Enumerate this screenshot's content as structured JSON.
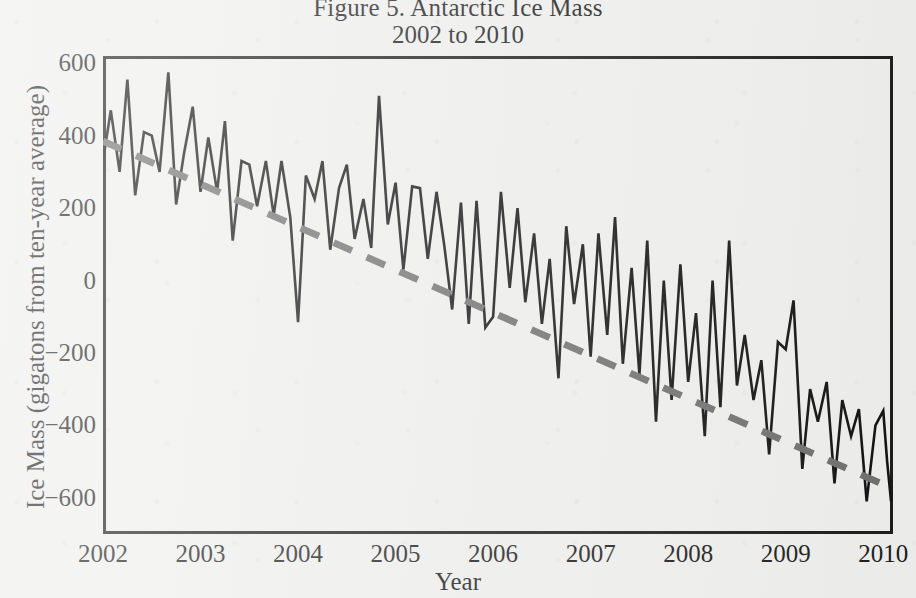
{
  "figure": {
    "title": "Figure 5. Antarctic Ice Mass",
    "subtitle": "2002 to 2010"
  },
  "axis": {
    "x_title": "Year",
    "y_title": "Ice Mass (gigatons from ten-year average)"
  },
  "chart_data": {
    "type": "line",
    "title": "Figure 5. Antarctic Ice Mass",
    "subtitle": "2002 to 2010",
    "xlabel": "Year",
    "ylabel": "Ice Mass (gigatons from ten-year average)",
    "xlim": [
      2002.0,
      2010.1
    ],
    "ylim": [
      -700,
      620
    ],
    "xticks": [
      2002,
      2003,
      2004,
      2005,
      2006,
      2007,
      2008,
      2009,
      2010
    ],
    "xtick_labels": [
      "2002",
      "2003",
      "2004",
      "2005",
      "2006",
      "2007",
      "2008",
      "2009",
      "2010"
    ],
    "yticks": [
      600,
      400,
      200,
      0,
      -200,
      -400,
      -600
    ],
    "ytick_labels": [
      "600",
      "400",
      "200",
      "0",
      "−200",
      "−400",
      "−600"
    ],
    "grid": false,
    "legend": false,
    "frame": true,
    "series": [
      {
        "name": "Ice mass anomaly (monthly)",
        "style": "solid",
        "color": "#111111",
        "linewidth": 2.6,
        "x": [
          2002.0,
          2002.08,
          2002.17,
          2002.25,
          2002.33,
          2002.42,
          2002.5,
          2002.58,
          2002.67,
          2002.75,
          2002.83,
          2002.92,
          2003.0,
          2003.08,
          2003.17,
          2003.25,
          2003.33,
          2003.42,
          2003.5,
          2003.58,
          2003.67,
          2003.75,
          2003.83,
          2003.92,
          2004.0,
          2004.08,
          2004.17,
          2004.25,
          2004.33,
          2004.42,
          2004.5,
          2004.58,
          2004.67,
          2004.75,
          2004.83,
          2004.92,
          2005.0,
          2005.08,
          2005.17,
          2005.25,
          2005.33,
          2005.42,
          2005.5,
          2005.58,
          2005.67,
          2005.75,
          2005.83,
          2005.92,
          2006.0,
          2006.08,
          2006.17,
          2006.25,
          2006.33,
          2006.42,
          2006.5,
          2006.58,
          2006.67,
          2006.75,
          2006.83,
          2006.92,
          2007.0,
          2007.08,
          2007.17,
          2007.25,
          2007.33,
          2007.42,
          2007.5,
          2007.58,
          2007.67,
          2007.75,
          2007.83,
          2007.92,
          2008.0,
          2008.08,
          2008.17,
          2008.25,
          2008.33,
          2008.42,
          2008.5,
          2008.58,
          2008.67,
          2008.75,
          2008.83,
          2008.92,
          2009.0,
          2009.08,
          2009.17,
          2009.25,
          2009.33,
          2009.42,
          2009.5,
          2009.58,
          2009.67,
          2009.75,
          2009.83,
          2009.92,
          2010.0,
          2010.04,
          2010.08
        ],
        "y": [
          330,
          470,
          300,
          555,
          235,
          410,
          400,
          300,
          575,
          210,
          350,
          480,
          245,
          395,
          245,
          440,
          110,
          330,
          320,
          205,
          330,
          180,
          330,
          175,
          -115,
          290,
          225,
          330,
          85,
          255,
          320,
          115,
          225,
          90,
          510,
          155,
          270,
          30,
          260,
          255,
          60,
          245,
          95,
          -80,
          215,
          -120,
          220,
          -130,
          -100,
          245,
          -20,
          200,
          -60,
          130,
          -120,
          60,
          -270,
          150,
          -65,
          100,
          -210,
          130,
          -150,
          175,
          -230,
          35,
          -260,
          110,
          -390,
          0,
          -330,
          45,
          -280,
          -90,
          -430,
          0,
          -350,
          110,
          -290,
          -150,
          -330,
          -220,
          -480,
          -170,
          -190,
          -55,
          -520,
          -300,
          -390,
          -280,
          -560,
          -330,
          -430,
          -355,
          -610,
          -400,
          -360,
          -500,
          -610
        ]
      },
      {
        "name": "Linear trend",
        "style": "dashed",
        "color": "#6f6f6f",
        "linewidth": 7,
        "x": [
          2002.0,
          2010.1
        ],
        "y": [
          385,
          -575
        ]
      }
    ],
    "annotations": []
  }
}
